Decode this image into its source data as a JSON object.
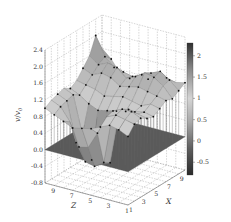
{
  "chart_data": {
    "type": "surface3d",
    "title": "",
    "zlabel": "v/v0",
    "xlabel": "X",
    "ylabel": "Z",
    "x_ticks": [
      "1",
      "3",
      "5",
      "7",
      "9"
    ],
    "y_ticks": [
      "1",
      "3",
      "5",
      "7",
      "9"
    ],
    "z_ticks": [
      "2.4",
      "2.0",
      "1.6",
      "1.2",
      "0.8",
      "0.4",
      "0.0",
      "-0.4",
      "-0.8"
    ],
    "zlim": [
      -0.8,
      2.4
    ],
    "xlim": [
      1,
      10
    ],
    "ylim": [
      1,
      10
    ],
    "grid": true,
    "colorbar": {
      "ticks": [
        "2",
        "1.5",
        "1",
        "0.5",
        "0",
        "-0.5"
      ],
      "range": [
        -0.8,
        2.3
      ],
      "colormap": "gray (dark at extremes, light near 1)"
    },
    "reference_plane": {
      "z": 0.0,
      "color": "#5a5a5a"
    },
    "x": [
      1,
      2,
      3,
      4,
      5,
      6,
      7,
      8,
      9,
      10
    ],
    "y": [
      1,
      2,
      3,
      4,
      5,
      6,
      7,
      8,
      9,
      10
    ],
    "z_grid": [
      [
        0.85,
        1.05,
        1.1,
        1.0,
        0.95,
        1.05,
        1.15,
        1.1,
        1.2,
        1.3
      ],
      [
        0.95,
        1.1,
        1.2,
        1.05,
        1.0,
        1.1,
        1.2,
        1.35,
        1.4,
        1.25
      ],
      [
        1.0,
        1.15,
        1.2,
        1.1,
        0.95,
        1.0,
        1.25,
        1.5,
        1.55,
        1.3
      ],
      [
        0.9,
        1.05,
        1.1,
        1.0,
        0.9,
        1.05,
        1.3,
        1.55,
        1.45,
        1.2
      ],
      [
        0.8,
        0.6,
        -0.2,
        -0.3,
        0.85,
        1.1,
        1.25,
        1.4,
        1.35,
        1.15
      ],
      [
        0.75,
        0.2,
        -0.35,
        -0.4,
        0.8,
        1.05,
        1.2,
        1.3,
        1.25,
        1.1
      ],
      [
        0.7,
        0.15,
        -0.3,
        -0.35,
        0.75,
        1.0,
        1.35,
        1.5,
        1.3,
        1.05
      ],
      [
        0.8,
        0.7,
        0.1,
        0.2,
        0.85,
        1.1,
        1.4,
        1.55,
        1.35,
        1.1
      ],
      [
        0.9,
        1.0,
        1.05,
        1.1,
        1.0,
        1.15,
        1.3,
        1.45,
        1.55,
        1.4
      ],
      [
        1.0,
        1.1,
        1.15,
        1.2,
        1.1,
        1.2,
        1.4,
        1.6,
        2.0,
        1.6
      ]
    ]
  },
  "labels": {
    "zlabel_main": "v",
    "zlabel_sep": "/",
    "zlabel_den": "v",
    "zlabel_sub": "0",
    "xlabel": "X",
    "ylabel": "Z"
  }
}
